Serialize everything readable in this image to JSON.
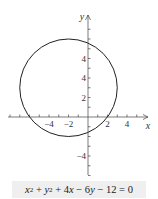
{
  "chart_data": {
    "type": "line",
    "title": "",
    "xlabel": "x",
    "ylabel": "y",
    "xlim": [
      -8,
      6
    ],
    "ylim": [
      -6,
      10
    ],
    "grid": false,
    "x_tick_labels": [
      "-4",
      "-2",
      "2",
      "4"
    ],
    "y_tick_labels": [
      "4",
      "4",
      "2",
      "-4"
    ],
    "series": [
      {
        "name": "circle",
        "shape": "circle",
        "center": [
          -2,
          3
        ],
        "radius": 5,
        "color": "#222222"
      }
    ],
    "equation": "x² + y² + 4x − 6y − 12 = 0"
  },
  "colors": {
    "ink": "#222222",
    "caption_bg": "#efefef"
  },
  "labels": {
    "x_axis": "x",
    "y_axis": "y",
    "x_ticks": [
      {
        "v": -4,
        "t": "−4"
      },
      {
        "v": -2,
        "t": "−2"
      },
      {
        "v": 2,
        "t": "2"
      },
      {
        "v": 4,
        "t": "4"
      }
    ],
    "y_ticks": [
      {
        "v": 6,
        "t": "4"
      },
      {
        "v": 4,
        "t": "4"
      },
      {
        "v": 2,
        "t": "2"
      },
      {
        "v": -4,
        "t": "−4"
      }
    ]
  },
  "caption": {
    "x2": "x",
    "sup2a": "2",
    "plus1": " + ",
    "y2": "y",
    "sup2b": "2",
    "rest1": " + 4",
    "x": "x",
    "rest2": " − 6",
    "y": "y",
    "rest3": " − 12 = 0"
  }
}
